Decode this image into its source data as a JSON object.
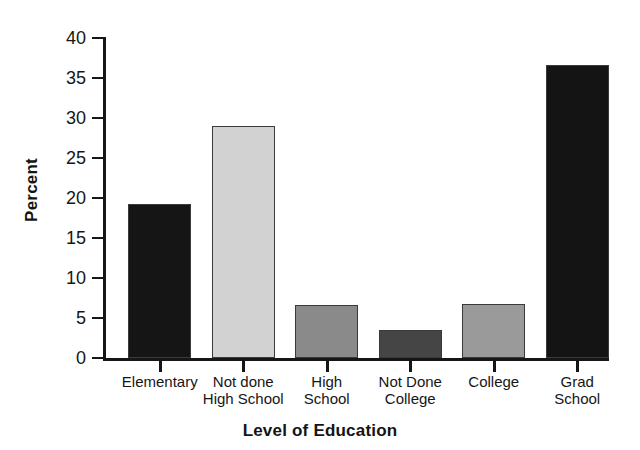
{
  "chart_data": {
    "type": "bar",
    "title": "",
    "xlabel": "Level of Education",
    "ylabel": "Percent",
    "categories": [
      "Elementary",
      "Not done\nHigh School",
      "High\nSchool",
      "Not Done\nCollege",
      "College",
      "Grad\nSchool"
    ],
    "values": [
      19.2,
      29.0,
      6.6,
      3.5,
      6.8,
      36.6
    ],
    "bar_colors": [
      "#151515",
      "#d2d2d2",
      "#8a8a8a",
      "#454545",
      "#9a9a9a",
      "#141414"
    ],
    "ylim": [
      0,
      40
    ],
    "ytick_labels": [
      "0",
      "5",
      "10",
      "15",
      "20",
      "25",
      "30",
      "35",
      "40"
    ],
    "ytick_values": [
      0,
      5,
      10,
      15,
      20,
      25,
      30,
      35,
      40
    ],
    "grid": false,
    "legend": "none",
    "axis_color": "#161616",
    "background": "#ffffff"
  }
}
